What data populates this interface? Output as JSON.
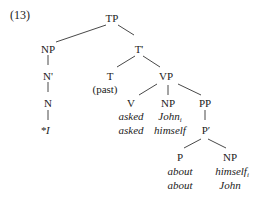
{
  "example_number": "(13)",
  "tree": {
    "TP": "TP",
    "NP_subject": "NP",
    "T_bar": "T'",
    "N_bar": "N'",
    "T": "T",
    "T_feature": "(past)",
    "VP": "VP",
    "N": "N",
    "subject_word": "*I",
    "V": "V",
    "V_word1": "asked",
    "V_word2": "asked",
    "NP_object": "NP",
    "object_word1": "John",
    "object_word1_index": "i",
    "object_word2": "himself",
    "PP": "PP",
    "P_bar": "P′",
    "P": "P",
    "P_word1": "about",
    "P_word2": "about",
    "NP_pobj": "NP",
    "pobj_word1": "himself",
    "pobj_word1_index": "i",
    "pobj_word2": "John"
  }
}
